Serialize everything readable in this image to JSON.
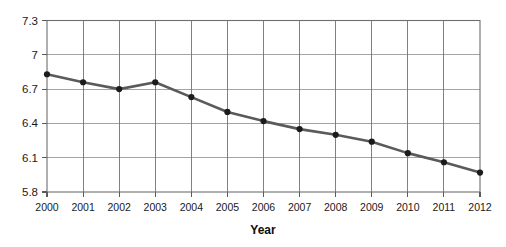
{
  "chart_data": {
    "type": "line",
    "title": "",
    "subtitle": "",
    "xlabel": "Year",
    "ylabel": "",
    "categories": [
      "2000",
      "2001",
      "2002",
      "2003",
      "2004",
      "2005",
      "2006",
      "2007",
      "2008",
      "2009",
      "2010",
      "2011",
      "2012"
    ],
    "x": [
      2000,
      2001,
      2002,
      2003,
      2004,
      2005,
      2006,
      2007,
      2008,
      2009,
      2010,
      2011,
      2012
    ],
    "values": [
      6.83,
      6.76,
      6.7,
      6.76,
      6.63,
      6.5,
      6.42,
      6.35,
      6.3,
      6.24,
      6.14,
      6.06,
      5.97
    ],
    "series": [
      {
        "name": "",
        "values": [
          6.83,
          6.76,
          6.7,
          6.76,
          6.63,
          6.5,
          6.42,
          6.35,
          6.3,
          6.24,
          6.14,
          6.06,
          5.97
        ]
      }
    ],
    "ylim": [
      5.8,
      7.3
    ],
    "xlim": [
      2000,
      2012
    ],
    "yticks": [
      5.8,
      6.1,
      6.4,
      6.7,
      7.0,
      7.3
    ],
    "ytick_labels": [
      "5.8",
      "6.1",
      "6.4",
      "6.7",
      "7",
      "7.3"
    ],
    "xtick_labels": [
      "2000",
      "2001",
      "2002",
      "2003",
      "2004",
      "2005",
      "2006",
      "2007",
      "2008",
      "2009",
      "2010",
      "2011",
      "2012"
    ],
    "grid": {
      "horizontal": true,
      "vertical": true
    },
    "legend": {
      "visible": false,
      "position": "none",
      "entries": []
    },
    "markers": "filled-circle",
    "colors": {
      "line": "#5a5a5a",
      "marker": "#1b1b1b",
      "grid_horizontal": "#9a9a9a",
      "grid_vertical": "#737373",
      "axis": "#6e6e6e",
      "text": "#1a1a1a",
      "background": "#ffffff"
    },
    "annotations": []
  },
  "axis_titles": {
    "x": "Year",
    "y": ""
  }
}
